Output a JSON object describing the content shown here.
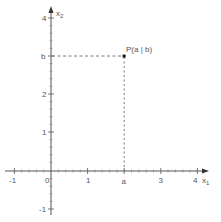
{
  "diagram": {
    "x_axis": {
      "label_main": "x",
      "label_sub": "1",
      "ticks": [
        {
          "value": -1,
          "label": "-1"
        },
        {
          "value": 0,
          "label": "0"
        },
        {
          "value": 1,
          "label": "1"
        },
        {
          "value": 2,
          "label": "a"
        },
        {
          "value": 3,
          "label": "3"
        },
        {
          "value": 4,
          "label": "4"
        }
      ]
    },
    "y_axis": {
      "label_main": "x",
      "label_sub": "2",
      "ticks": [
        {
          "value": -1,
          "label": "-1"
        },
        {
          "value": 1,
          "label": "1"
        },
        {
          "value": 2,
          "label": "2"
        },
        {
          "value": 3,
          "label": "b"
        },
        {
          "value": 4,
          "label": "4"
        }
      ]
    },
    "point": {
      "label": "P(a | b)",
      "x": 2,
      "y": 3
    },
    "colors": {
      "axis": "#555555",
      "dashed": "#555555",
      "point": "#111111"
    }
  }
}
